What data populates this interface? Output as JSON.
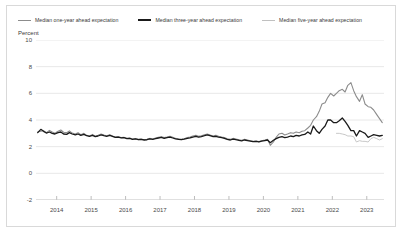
{
  "chart_data": {
    "type": "line",
    "title": "",
    "subtitle": "",
    "xlabel": "",
    "ylabel": "Percent",
    "ylim": [
      -2,
      10
    ],
    "xlim": [
      2013.4,
      2023.5
    ],
    "yticks": [
      10,
      8,
      6,
      4,
      2,
      0,
      -2
    ],
    "xticks": [
      2014,
      2015,
      2016,
      2017,
      2018,
      2019,
      2020,
      2021,
      2022,
      2023
    ],
    "grid": true,
    "legend_position": "top",
    "x_tickmarks": true,
    "series": [
      {
        "name": "Median one-year ahead expectation",
        "color": "#8c8c8c",
        "width": 1.1,
        "points": [
          [
            2013.45,
            3.1
          ],
          [
            2013.54,
            3.15
          ],
          [
            2013.62,
            3.2
          ],
          [
            2013.7,
            3.05
          ],
          [
            2013.79,
            3.22
          ],
          [
            2013.87,
            3.1
          ],
          [
            2013.95,
            3.0
          ],
          [
            2014.04,
            3.15
          ],
          [
            2014.12,
            3.25
          ],
          [
            2014.2,
            3.08
          ],
          [
            2014.29,
            3.05
          ],
          [
            2014.37,
            3.18
          ],
          [
            2014.45,
            3.02
          ],
          [
            2014.54,
            2.95
          ],
          [
            2014.62,
            3.05
          ],
          [
            2014.7,
            2.9
          ],
          [
            2014.79,
            3.0
          ],
          [
            2014.87,
            2.85
          ],
          [
            2014.95,
            2.8
          ],
          [
            2015.04,
            2.92
          ],
          [
            2015.12,
            2.78
          ],
          [
            2015.2,
            2.85
          ],
          [
            2015.29,
            2.95
          ],
          [
            2015.37,
            2.88
          ],
          [
            2015.45,
            2.82
          ],
          [
            2015.54,
            2.9
          ],
          [
            2015.62,
            2.8
          ],
          [
            2015.7,
            2.72
          ],
          [
            2015.79,
            2.75
          ],
          [
            2015.87,
            2.68
          ],
          [
            2015.95,
            2.7
          ],
          [
            2016.04,
            2.62
          ],
          [
            2016.12,
            2.65
          ],
          [
            2016.2,
            2.58
          ],
          [
            2016.29,
            2.6
          ],
          [
            2016.37,
            2.55
          ],
          [
            2016.45,
            2.58
          ],
          [
            2016.54,
            2.52
          ],
          [
            2016.62,
            2.55
          ],
          [
            2016.7,
            2.62
          ],
          [
            2016.79,
            2.58
          ],
          [
            2016.87,
            2.65
          ],
          [
            2016.95,
            2.7
          ],
          [
            2017.04,
            2.75
          ],
          [
            2017.12,
            2.68
          ],
          [
            2017.2,
            2.72
          ],
          [
            2017.29,
            2.78
          ],
          [
            2017.37,
            2.7
          ],
          [
            2017.45,
            2.62
          ],
          [
            2017.54,
            2.58
          ],
          [
            2017.62,
            2.55
          ],
          [
            2017.7,
            2.6
          ],
          [
            2017.79,
            2.68
          ],
          [
            2017.87,
            2.72
          ],
          [
            2017.95,
            2.8
          ],
          [
            2018.04,
            2.85
          ],
          [
            2018.12,
            2.78
          ],
          [
            2018.2,
            2.82
          ],
          [
            2018.29,
            2.9
          ],
          [
            2018.37,
            2.95
          ],
          [
            2018.45,
            2.88
          ],
          [
            2018.54,
            2.8
          ],
          [
            2018.62,
            2.85
          ],
          [
            2018.7,
            2.78
          ],
          [
            2018.79,
            2.72
          ],
          [
            2018.87,
            2.68
          ],
          [
            2018.95,
            2.6
          ],
          [
            2019.04,
            2.55
          ],
          [
            2019.12,
            2.62
          ],
          [
            2019.2,
            2.58
          ],
          [
            2019.29,
            2.52
          ],
          [
            2019.37,
            2.48
          ],
          [
            2019.45,
            2.55
          ],
          [
            2019.54,
            2.5
          ],
          [
            2019.62,
            2.45
          ],
          [
            2019.7,
            2.4
          ],
          [
            2019.79,
            2.42
          ],
          [
            2019.87,
            2.38
          ],
          [
            2019.95,
            2.45
          ],
          [
            2020.04,
            2.5
          ],
          [
            2020.12,
            2.55
          ],
          [
            2020.2,
            2.1
          ],
          [
            2020.29,
            2.35
          ],
          [
            2020.37,
            2.7
          ],
          [
            2020.45,
            2.95
          ],
          [
            2020.54,
            3.0
          ],
          [
            2020.62,
            2.88
          ],
          [
            2020.7,
            2.95
          ],
          [
            2020.79,
            3.05
          ],
          [
            2020.87,
            3.0
          ],
          [
            2020.95,
            3.1
          ],
          [
            2021.04,
            3.05
          ],
          [
            2021.12,
            3.15
          ],
          [
            2021.2,
            3.2
          ],
          [
            2021.29,
            3.4
          ],
          [
            2021.37,
            3.6
          ],
          [
            2021.45,
            4.0
          ],
          [
            2021.54,
            4.25
          ],
          [
            2021.62,
            4.65
          ],
          [
            2021.7,
            5.2
          ],
          [
            2021.79,
            5.3
          ],
          [
            2021.87,
            5.7
          ],
          [
            2021.95,
            6.0
          ],
          [
            2022.04,
            5.8
          ],
          [
            2022.12,
            6.0
          ],
          [
            2022.2,
            6.2
          ],
          [
            2022.29,
            6.3
          ],
          [
            2022.37,
            6.1
          ],
          [
            2022.45,
            6.6
          ],
          [
            2022.54,
            6.8
          ],
          [
            2022.62,
            6.2
          ],
          [
            2022.7,
            5.75
          ],
          [
            2022.79,
            5.4
          ],
          [
            2022.87,
            5.9
          ],
          [
            2022.95,
            5.2
          ],
          [
            2023.04,
            5.0
          ],
          [
            2023.12,
            4.95
          ],
          [
            2023.2,
            4.75
          ],
          [
            2023.29,
            4.4
          ],
          [
            2023.37,
            4.1
          ],
          [
            2023.45,
            3.8
          ]
        ]
      },
      {
        "name": "Median three-year ahead expectation",
        "color": "#1a1a1a",
        "width": 1.3,
        "points": [
          [
            2013.45,
            3.05
          ],
          [
            2013.54,
            3.3
          ],
          [
            2013.62,
            3.15
          ],
          [
            2013.7,
            3.02
          ],
          [
            2013.79,
            3.1
          ],
          [
            2013.87,
            3.0
          ],
          [
            2013.95,
            2.95
          ],
          [
            2014.04,
            3.05
          ],
          [
            2014.12,
            3.1
          ],
          [
            2014.2,
            2.95
          ],
          [
            2014.29,
            2.92
          ],
          [
            2014.37,
            3.05
          ],
          [
            2014.45,
            2.95
          ],
          [
            2014.54,
            2.88
          ],
          [
            2014.62,
            2.95
          ],
          [
            2014.7,
            2.85
          ],
          [
            2014.79,
            2.92
          ],
          [
            2014.87,
            2.82
          ],
          [
            2014.95,
            2.78
          ],
          [
            2015.04,
            2.85
          ],
          [
            2015.12,
            2.75
          ],
          [
            2015.2,
            2.8
          ],
          [
            2015.29,
            2.88
          ],
          [
            2015.37,
            2.82
          ],
          [
            2015.45,
            2.78
          ],
          [
            2015.54,
            2.85
          ],
          [
            2015.62,
            2.78
          ],
          [
            2015.7,
            2.7
          ],
          [
            2015.79,
            2.72
          ],
          [
            2015.87,
            2.66
          ],
          [
            2015.95,
            2.68
          ],
          [
            2016.04,
            2.6
          ],
          [
            2016.12,
            2.62
          ],
          [
            2016.2,
            2.55
          ],
          [
            2016.29,
            2.58
          ],
          [
            2016.37,
            2.52
          ],
          [
            2016.45,
            2.55
          ],
          [
            2016.54,
            2.5
          ],
          [
            2016.62,
            2.52
          ],
          [
            2016.7,
            2.58
          ],
          [
            2016.79,
            2.55
          ],
          [
            2016.87,
            2.6
          ],
          [
            2016.95,
            2.65
          ],
          [
            2017.04,
            2.7
          ],
          [
            2017.12,
            2.62
          ],
          [
            2017.2,
            2.68
          ],
          [
            2017.29,
            2.72
          ],
          [
            2017.37,
            2.65
          ],
          [
            2017.45,
            2.58
          ],
          [
            2017.54,
            2.55
          ],
          [
            2017.62,
            2.52
          ],
          [
            2017.7,
            2.56
          ],
          [
            2017.79,
            2.62
          ],
          [
            2017.87,
            2.66
          ],
          [
            2017.95,
            2.72
          ],
          [
            2018.04,
            2.78
          ],
          [
            2018.12,
            2.72
          ],
          [
            2018.2,
            2.76
          ],
          [
            2018.29,
            2.82
          ],
          [
            2018.37,
            2.88
          ],
          [
            2018.45,
            2.82
          ],
          [
            2018.54,
            2.75
          ],
          [
            2018.62,
            2.78
          ],
          [
            2018.7,
            2.72
          ],
          [
            2018.79,
            2.68
          ],
          [
            2018.87,
            2.62
          ],
          [
            2018.95,
            2.55
          ],
          [
            2019.04,
            2.5
          ],
          [
            2019.12,
            2.56
          ],
          [
            2019.2,
            2.52
          ],
          [
            2019.29,
            2.48
          ],
          [
            2019.37,
            2.44
          ],
          [
            2019.45,
            2.5
          ],
          [
            2019.54,
            2.46
          ],
          [
            2019.62,
            2.42
          ],
          [
            2019.7,
            2.38
          ],
          [
            2019.79,
            2.4
          ],
          [
            2019.87,
            2.36
          ],
          [
            2019.95,
            2.42
          ],
          [
            2020.04,
            2.46
          ],
          [
            2020.12,
            2.5
          ],
          [
            2020.2,
            2.3
          ],
          [
            2020.29,
            2.48
          ],
          [
            2020.37,
            2.6
          ],
          [
            2020.45,
            2.7
          ],
          [
            2020.54,
            2.75
          ],
          [
            2020.62,
            2.68
          ],
          [
            2020.7,
            2.72
          ],
          [
            2020.79,
            2.8
          ],
          [
            2020.87,
            2.75
          ],
          [
            2020.95,
            2.85
          ],
          [
            2021.04,
            2.8
          ],
          [
            2021.12,
            2.88
          ],
          [
            2021.2,
            2.92
          ],
          [
            2021.29,
            3.1
          ],
          [
            2021.37,
            2.95
          ],
          [
            2021.45,
            3.55
          ],
          [
            2021.54,
            3.2
          ],
          [
            2021.62,
            3.0
          ],
          [
            2021.7,
            3.3
          ],
          [
            2021.79,
            3.55
          ],
          [
            2021.87,
            4.0
          ],
          [
            2021.95,
            4.0
          ],
          [
            2022.04,
            3.8
          ],
          [
            2022.12,
            3.8
          ],
          [
            2022.2,
            3.95
          ],
          [
            2022.29,
            4.15
          ],
          [
            2022.37,
            3.9
          ],
          [
            2022.45,
            3.6
          ],
          [
            2022.54,
            3.2
          ],
          [
            2022.62,
            3.2
          ],
          [
            2022.7,
            2.8
          ],
          [
            2022.79,
            3.2
          ],
          [
            2022.87,
            3.1
          ],
          [
            2022.95,
            3.0
          ],
          [
            2023.04,
            2.7
          ],
          [
            2023.12,
            2.8
          ],
          [
            2023.2,
            2.9
          ],
          [
            2023.29,
            2.85
          ],
          [
            2023.37,
            2.8
          ],
          [
            2023.45,
            2.85
          ]
        ]
      },
      {
        "name": "Median five-year ahead expectation",
        "color": "#c8c8c8",
        "width": 1.0,
        "points": [
          [
            2022.12,
            3.0
          ],
          [
            2022.2,
            3.0
          ],
          [
            2022.29,
            2.95
          ],
          [
            2022.37,
            2.9
          ],
          [
            2022.45,
            2.8
          ],
          [
            2022.54,
            2.8
          ],
          [
            2022.62,
            2.75
          ],
          [
            2022.7,
            2.35
          ],
          [
            2022.79,
            2.45
          ],
          [
            2022.87,
            2.4
          ],
          [
            2022.95,
            2.4
          ],
          [
            2023.04,
            2.35
          ],
          [
            2023.12,
            2.6
          ],
          [
            2023.2,
            2.7
          ],
          [
            2023.29,
            2.6
          ],
          [
            2023.37,
            2.5
          ],
          [
            2023.45,
            2.6
          ]
        ]
      }
    ]
  },
  "legend": {
    "items": [
      {
        "label": "Median one-year ahead expectation",
        "swatch": "line-swatch-one-year"
      },
      {
        "label": "Median three-year ahead expectation",
        "swatch": "line-swatch-three-year"
      },
      {
        "label": "Median five-year ahead expectation",
        "swatch": "line-swatch-five-year"
      }
    ]
  },
  "axis": {
    "unit_label": "Percent",
    "y_ticks": [
      "10",
      "8",
      "6",
      "4",
      "2",
      "0",
      "-2"
    ],
    "x_ticks": [
      "2014",
      "2015",
      "2016",
      "2017",
      "2018",
      "2019",
      "2020",
      "2021",
      "2022",
      "2023"
    ]
  },
  "colors": {
    "one_year": "#8c8c8c",
    "three_year": "#1a1a1a",
    "five_year": "#c8c8c8",
    "grid": "#e8e8e8",
    "border": "#d9d9d9",
    "text": "#3a3a3a",
    "background": "#ffffff"
  }
}
